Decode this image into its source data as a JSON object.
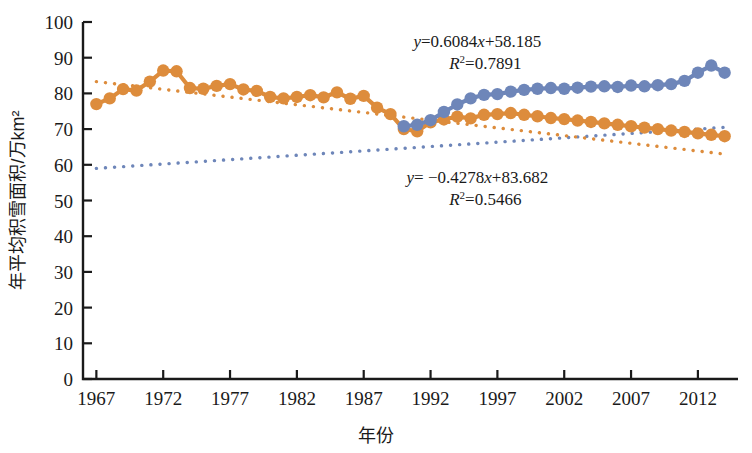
{
  "chart_data": {
    "type": "line",
    "title": "",
    "xlabel": "年份",
    "ylabel": "年平均积雪面积/万km²",
    "xlim": [
      1966,
      2015
    ],
    "ylim": [
      0,
      100
    ],
    "grid": false,
    "legend": "none",
    "xticks": [
      1967,
      1972,
      1977,
      1982,
      1987,
      1992,
      1997,
      2002,
      2007,
      2012
    ],
    "yticks": [
      0,
      10,
      20,
      30,
      40,
      50,
      60,
      70,
      80,
      90,
      100
    ],
    "series": [
      {
        "name": "前期积雪面积（橙色）",
        "color": "#DD8C3C",
        "marker": "circle",
        "x": [
          1967,
          1968,
          1969,
          1970,
          1971,
          1972,
          1973,
          1974,
          1975,
          1976,
          1977,
          1978,
          1979,
          1980,
          1981,
          1982,
          1983,
          1984,
          1985,
          1986,
          1987,
          1988,
          1989,
          1990,
          1991,
          1992,
          1993,
          1994,
          1995,
          1996,
          1997,
          1998,
          1999,
          2000,
          2001,
          2002,
          2003,
          2004,
          2005,
          2006,
          2007,
          2008,
          2009,
          2010,
          2011,
          2012,
          2013,
          2014
        ],
        "values": [
          77.0,
          78.6,
          81.2,
          80.8,
          83.3,
          86.4,
          86.2,
          81.5,
          81.3,
          82.1,
          82.6,
          81.1,
          80.7,
          79.0,
          78.6,
          79.0,
          79.5,
          78.9,
          80.3,
          78.5,
          79.3,
          76.0,
          74.2,
          70.0,
          69.4,
          71.9,
          72.7,
          73.5,
          73.0,
          74.0,
          74.2,
          74.5,
          74.0,
          73.6,
          73.1,
          72.8,
          72.4,
          72.0,
          71.6,
          71.2,
          70.8,
          70.4,
          70.0,
          69.6,
          69.2,
          68.8,
          68.4,
          68.0
        ]
      },
      {
        "name": "后期积雪面积（蓝色）",
        "color": "#6E86B9",
        "marker": "circle",
        "x": [
          1990,
          1991,
          1992,
          1993,
          1994,
          1995,
          1996,
          1997,
          1998,
          1999,
          2000,
          2001,
          2002,
          2003,
          2004,
          2005,
          2006,
          2007,
          2008,
          2009,
          2010,
          2011,
          2012,
          2013,
          2014
        ],
        "values": [
          70.8,
          71.2,
          72.5,
          74.8,
          76.9,
          78.6,
          79.6,
          79.8,
          80.5,
          81.0,
          81.3,
          81.5,
          81.3,
          81.6,
          81.9,
          82.0,
          81.8,
          82.2,
          82.0,
          82.3,
          82.6,
          83.5,
          85.8,
          87.8,
          85.8
        ]
      }
    ],
    "trendlines": [
      {
        "name": "blue-trend",
        "color": "#6E86B9",
        "style": "dotted",
        "x_start": 1967,
        "x_end": 2014,
        "y_start": 59.0,
        "y_end": 70.5,
        "equation": "y=0.6084x+58.185",
        "r_squared": "R²=0.7891"
      },
      {
        "name": "orange-trend",
        "color": "#DD8C3C",
        "style": "dotted",
        "x_start": 1967,
        "x_end": 2014,
        "y_start": 83.3,
        "y_end": 63.0,
        "equation": "y= −0.4278x+83.682",
        "r_squared": "R²=0.5466"
      }
    ],
    "annotations": [
      {
        "id": "upper-equation",
        "line1_prefix": "y",
        "line1_rest": "=0.6084",
        "line1_var": "x",
        "line1_tail": "+58.185",
        "line2_prefix": "R",
        "line2_sup": "2",
        "line2_tail": "=0.7891",
        "x": 1995.5,
        "y": 93.0
      },
      {
        "id": "lower-equation",
        "line1_prefix": "y",
        "line1_rest": "= −0.4278",
        "line1_var": "x",
        "line1_tail": "+83.682",
        "line2_prefix": "R",
        "line2_sup": "2",
        "line2_tail": "=0.5466",
        "x": 1995.5,
        "y": 55.0
      }
    ]
  },
  "axis": {
    "y_label": "年平均积雪面积/万km²",
    "x_label": "年份"
  }
}
